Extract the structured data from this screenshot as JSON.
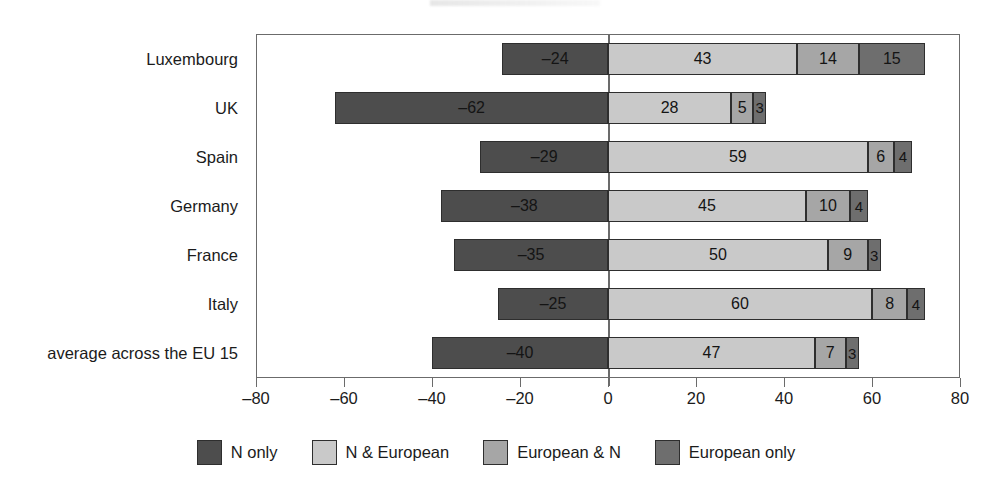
{
  "chart_data": {
    "type": "bar",
    "orientation": "horizontal",
    "stacked": true,
    "diverging": true,
    "title": "",
    "subtitle": "",
    "xlabel": "",
    "ylabel": "",
    "xlim": [
      -80,
      80
    ],
    "xticks": [
      -80,
      -60,
      -40,
      -20,
      0,
      20,
      40,
      60,
      80
    ],
    "xtick_labels": [
      "–80",
      "–60",
      "–40",
      "–20",
      "0",
      "20",
      "40",
      "60",
      "80"
    ],
    "grid": false,
    "legend_position": "bottom",
    "categories": [
      "Luxembourg",
      "UK",
      "Spain",
      "Germany",
      "France",
      "Italy",
      "average across the EU 15"
    ],
    "series": [
      {
        "name": "N only",
        "color": "#4d4d4d",
        "side": "negative",
        "values": [
          -24,
          -62,
          -29,
          -38,
          -35,
          -25,
          -40
        ],
        "labels": [
          "–24",
          "–62",
          "–29",
          "–38",
          "–35",
          "–25",
          "–40"
        ]
      },
      {
        "name": "N & European",
        "color": "#c9c9c9",
        "side": "positive",
        "values": [
          43,
          28,
          59,
          45,
          50,
          60,
          47
        ],
        "labels": [
          "43",
          "28",
          "59",
          "45",
          "50",
          "60",
          "47"
        ]
      },
      {
        "name": "European & N",
        "color": "#a6a6a6",
        "side": "positive",
        "values": [
          14,
          5,
          6,
          10,
          9,
          8,
          7
        ],
        "labels": [
          "14",
          "5",
          "6",
          "10",
          "9",
          "8",
          "7"
        ]
      },
      {
        "name": "European only",
        "color": "#6e6e6e",
        "side": "positive",
        "values": [
          15,
          3,
          4,
          4,
          3,
          4,
          3
        ],
        "labels": [
          "15",
          "3",
          "4",
          "4",
          "3",
          "4",
          "3"
        ]
      }
    ]
  },
  "axis": {
    "zero_label": "0",
    "frame_color": "#6b6b6b"
  },
  "legend": {
    "items": [
      {
        "label": "N only",
        "color": "#4d4d4d"
      },
      {
        "label": "N & European",
        "color": "#c9c9c9"
      },
      {
        "label": "European & N",
        "color": "#a6a6a6"
      },
      {
        "label": "European only",
        "color": "#6e6e6e"
      }
    ]
  }
}
